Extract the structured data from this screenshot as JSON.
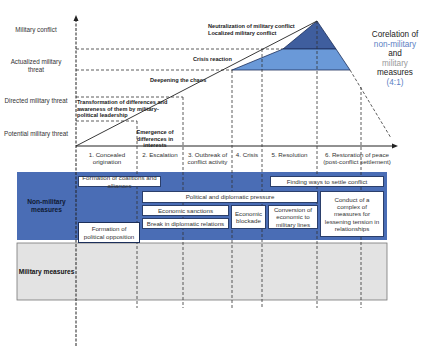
{
  "y_axis_levels": [
    {
      "label": "Military conflict"
    },
    {
      "label": "Actualized military threat"
    },
    {
      "label": "Directed military threat"
    },
    {
      "label": "Potential military threat"
    }
  ],
  "upper_annotations": {
    "neutralization": "Neutralization of military conflict",
    "localized": "Localized military conflict",
    "crisis_reaction": "Crisis reaction",
    "deepening": "Deepening the chaos",
    "transformation": "Transformation of differences and awareness of them by military-political leadership",
    "emergence": "Emergence of differences in interests"
  },
  "phases": [
    {
      "label": "1. Concealed origination"
    },
    {
      "label": "2. Escalation"
    },
    {
      "label": "3. Outbreak of conflict activity"
    },
    {
      "label": "4. Crisis"
    },
    {
      "label": "5. Resolution"
    },
    {
      "label": "6. Restoration of peace (post-conflict settlement)"
    }
  ],
  "correlation": {
    "line1": "Corelation of",
    "line2": "non-military",
    "line3": "and",
    "line4": "military",
    "line5": "measures",
    "ratio": "(4:1)",
    "colors": {
      "non_military": "#5b7fc4",
      "military": "#9a9a9a",
      "ratio": "#5b7fc4",
      "default": "#222222"
    }
  },
  "categories": {
    "non_military": "Non-military measures",
    "military": "Military measures"
  },
  "non_military_measures": {
    "coalitions": "Formation of coalitions and alliances",
    "settle": "Finding ways to settle conflict",
    "pressure": "Political and diplomatic pressure",
    "sanctions": "Economic sanctions",
    "break_relations": "Break in diplomatic relations",
    "blockade": "Economic blockade",
    "conversion": "Conversion of economic to military lines",
    "complex": "Conduct of a complex of measures for lessening tension in relationships",
    "opposition": "Formation of political opposition",
    "opposition_forces": "Activity of opposition forces",
    "leadership_change": "Chance of mil-political leadership",
    "info_warfare": "Conduct of information warfare"
  },
  "military_measures": {
    "strategic_control": "Military measures of strategic control",
    "deployment": "Strategic deployment",
    "military_actions": "Conduct of military actions",
    "peacekeeping": "Peacekeeping operations"
  },
  "colors": {
    "non_military_band": "#4a6db5",
    "military_band": "#e3e3e3",
    "triangle_dark": "#3f5e9e",
    "triangle_light": "#6a99d8",
    "box_border": "#2b3f6b"
  }
}
